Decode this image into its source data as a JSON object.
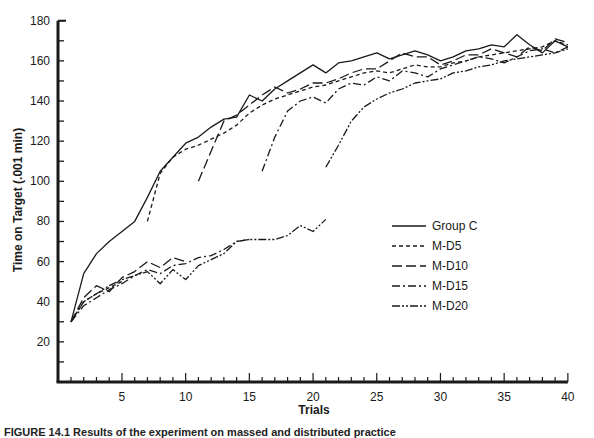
{
  "chart_data": {
    "type": "line",
    "title": "",
    "xlabel": "Trials",
    "ylabel": "Time on Target (.001 min)",
    "xlim": [
      0,
      40
    ],
    "ylim": [
      0,
      180
    ],
    "x_ticks": [
      5,
      10,
      15,
      20,
      25,
      30,
      35,
      40
    ],
    "y_ticks": [
      20,
      40,
      60,
      80,
      100,
      120,
      140,
      160,
      180
    ],
    "grid": false,
    "legend_position": "right-center",
    "series": [
      {
        "name": "Group C",
        "style": "solid",
        "segments": [
          {
            "x": [
              1,
              2,
              3,
              4,
              5,
              6,
              7,
              8,
              9,
              10,
              11,
              12,
              13,
              14,
              15,
              16,
              17,
              18,
              19,
              20,
              21,
              22,
              23,
              24,
              25,
              26,
              27,
              28,
              29,
              30,
              31,
              32,
              33,
              34,
              35,
              36,
              37,
              38,
              39,
              40
            ],
            "y": [
              30,
              54,
              64,
              70,
              75,
              80,
              92,
              105,
              112,
              119,
              122,
              127,
              131,
              132,
              143,
              140,
              146,
              150,
              154,
              158,
              154,
              159,
              160,
              162,
              164,
              161,
              163,
              165,
              163,
              160,
              162,
              165,
              166,
              168,
              167,
              173,
              168,
              164,
              170,
              167
            ]
          }
        ]
      },
      {
        "name": "M-D5",
        "style": "dashed",
        "segments": [
          {
            "x": [
              1,
              2,
              3,
              4,
              5
            ],
            "y": [
              30,
              40,
              44,
              47,
              50
            ]
          },
          {
            "x": [
              7,
              8,
              9,
              10,
              11,
              12,
              13,
              14,
              15,
              16,
              17,
              18,
              19,
              20,
              21,
              22,
              23,
              24,
              25,
              26,
              27,
              28,
              29,
              30,
              31,
              32,
              33,
              34,
              35,
              36,
              37,
              38,
              39,
              40
            ],
            "y": [
              80,
              104,
              112,
              116,
              118,
              121,
              124,
              128,
              134,
              138,
              141,
              143,
              145,
              147,
              148,
              150,
              152,
              154,
              155,
              154,
              156,
              158,
              157,
              157,
              159,
              160,
              162,
              163,
              164,
              165,
              166,
              167,
              170,
              168
            ]
          }
        ]
      },
      {
        "name": "M-D10",
        "style": "long-dash",
        "segments": [
          {
            "x": [
              1,
              2,
              3,
              4,
              5,
              6,
              7,
              8,
              9,
              10
            ],
            "y": [
              30,
              42,
              48,
              45,
              52,
              55,
              60,
              57,
              62,
              60
            ]
          },
          {
            "x": [
              11,
              12,
              13,
              14,
              15,
              16,
              17,
              18,
              19,
              20,
              21,
              22,
              23,
              24,
              25,
              26,
              27,
              28,
              29,
              30,
              31,
              32,
              33,
              34,
              35,
              36,
              37,
              38,
              39,
              40
            ],
            "y": [
              100,
              115,
              130,
              133,
              138,
              143,
              147,
              144,
              146,
              149,
              149,
              151,
              154,
              156,
              156,
              160,
              164,
              162,
              162,
              158,
              160,
              163,
              163,
              166,
              164,
              162,
              167,
              165,
              171,
              169
            ]
          }
        ]
      },
      {
        "name": "M-D15",
        "style": "dash-dot",
        "segments": [
          {
            "x": [
              1,
              2,
              3,
              4,
              5,
              6,
              7,
              8,
              9,
              10,
              11,
              12,
              13,
              14,
              15
            ],
            "y": [
              30,
              38,
              42,
              46,
              49,
              53,
              56,
              54,
              58,
              59,
              62,
              63,
              66,
              70,
              71
            ]
          },
          {
            "x": [
              16,
              17,
              18,
              19,
              20,
              21,
              22,
              23,
              24,
              25,
              26,
              27,
              28,
              29,
              30,
              31,
              32,
              33,
              34,
              35,
              36,
              37,
              38,
              39,
              40
            ],
            "y": [
              105,
              122,
              135,
              140,
              142,
              139,
              146,
              149,
              148,
              152,
              150,
              155,
              154,
              152,
              156,
              158,
              160,
              162,
              161,
              159,
              162,
              165,
              166,
              164,
              167
            ]
          }
        ]
      },
      {
        "name": "M-D20",
        "style": "dash-dot-dot",
        "segments": [
          {
            "x": [
              1,
              2,
              3,
              4,
              5,
              6,
              7,
              8,
              9,
              10,
              11,
              12,
              13,
              14,
              15,
              16,
              17,
              18,
              19,
              20,
              21
            ],
            "y": [
              30,
              40,
              44,
              48,
              51,
              53,
              55,
              49,
              56,
              51,
              58,
              61,
              64,
              70,
              71,
              71,
              71,
              73,
              78,
              75,
              81
            ]
          },
          {
            "x": [
              21,
              22,
              23,
              24,
              25,
              26,
              27,
              28,
              29,
              30,
              31,
              32,
              33,
              34,
              35,
              36,
              37,
              38,
              39,
              40
            ],
            "y": [
              107,
              118,
              130,
              137,
              141,
              144,
              146,
              149,
              150,
              151,
              154,
              155,
              157,
              158,
              160,
              161,
              162,
              163,
              164,
              166
            ]
          }
        ]
      }
    ]
  },
  "legend": {
    "items": [
      {
        "label": "Group C",
        "style": "solid"
      },
      {
        "label": "M-D5",
        "style": "dashed"
      },
      {
        "label": "M-D10",
        "style": "long-dash"
      },
      {
        "label": "M-D15",
        "style": "dash-dot"
      },
      {
        "label": "M-D20",
        "style": "dash-dot-dot"
      }
    ]
  },
  "caption": "FIGURE 14.1  Results of the experiment on massed and distributed practice"
}
